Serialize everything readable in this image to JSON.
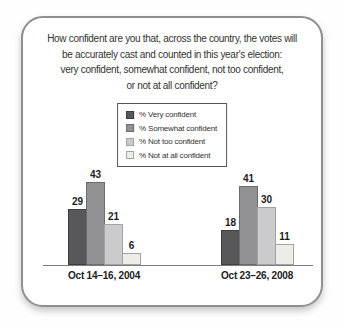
{
  "chart_data": {
    "type": "bar",
    "title_lines": [
      "How confident are you that, across the country, the votes will",
      "be accurately cast and counted in this year's election:",
      "very confident, somewhat confident, not too confident,",
      "or not at all confident?"
    ],
    "categories": [
      "Oct 14–16, 2004",
      "Oct 23–26, 2008"
    ],
    "series": [
      {
        "name": "% Very confident",
        "values": [
          29,
          18
        ],
        "color": "#58585b",
        "border": "#3e3e41"
      },
      {
        "name": "% Somewhat confident",
        "values": [
          43,
          41
        ],
        "color": "#919194",
        "border": "#6c6c6f"
      },
      {
        "name": "% Not too confident",
        "values": [
          21,
          30
        ],
        "color": "#cbcbcd",
        "border": "#a2a2a4"
      },
      {
        "name": "% Not at all confident",
        "values": [
          6,
          11
        ],
        "color": "#edede7",
        "border": "#a2a2a4"
      }
    ],
    "xlabel": "",
    "ylabel": "",
    "ylim": [
      0,
      50
    ],
    "grid": false,
    "legend_position": "top-center",
    "value_labels": true,
    "axis_color": "#7d7d7d",
    "text_color": "#333333",
    "card_border_color": "#8f8f8f"
  }
}
